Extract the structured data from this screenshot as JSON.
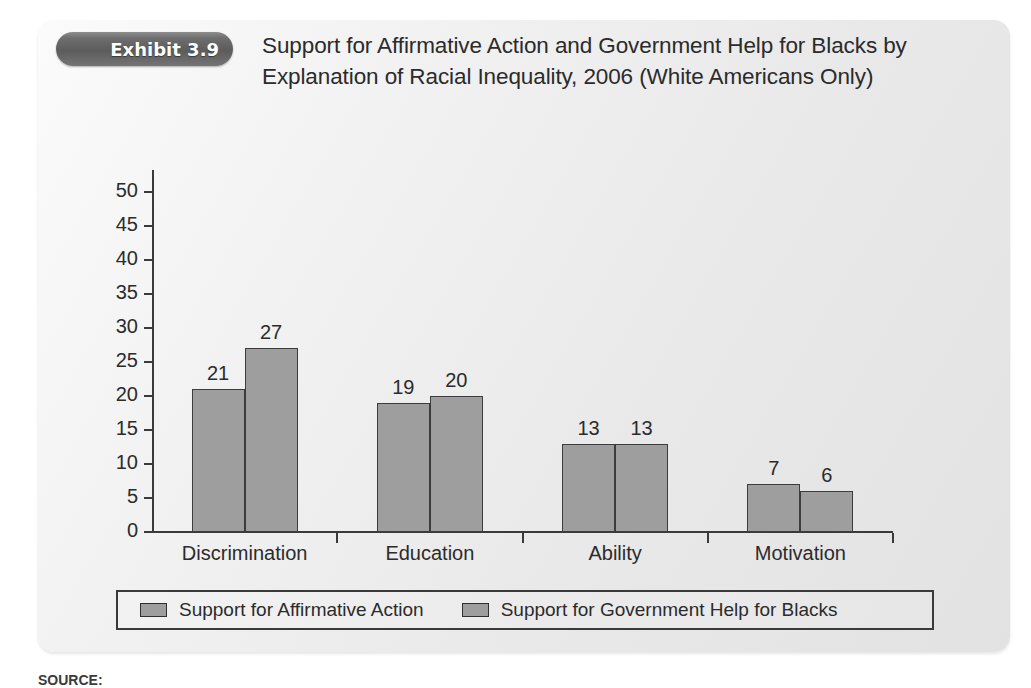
{
  "exhibit": {
    "badge_label": "Exhibit 3.9",
    "title": "Support for Affirmative Action and Government Help for Blacks by Explanation of Racial Inequality, 2006 (White Americans Only)"
  },
  "source": {
    "prefix": "SOURCE:",
    "text": ""
  },
  "colors": {
    "panel_light": "#fbfbfb",
    "panel_dark": "#e2e2e2",
    "bar_fill": "#9e9e9e",
    "bar_stroke": "#3c3c3c",
    "axis": "#3a3a3a",
    "badge_dark": "#5c5c5c",
    "text": "#2b2b2b"
  },
  "chart_data": {
    "type": "bar",
    "title": "Support for Affirmative Action and Government Help for Blacks by Explanation of Racial Inequality, 2006 (White Americans Only)",
    "xlabel": "",
    "ylabel": "",
    "ylim": [
      0,
      50
    ],
    "yticks": [
      0,
      5,
      10,
      15,
      20,
      25,
      30,
      35,
      40,
      45,
      50
    ],
    "ytick_labels": [
      "0",
      "5",
      "10",
      "15",
      "20",
      "25",
      "30",
      "35",
      "40",
      "45",
      "50"
    ],
    "grid": false,
    "legend_position": "bottom",
    "categories": [
      "Discrimination",
      "Education",
      "Ability",
      "Motivation"
    ],
    "series": [
      {
        "name": "Support for Affirmative Action",
        "values": [
          21,
          19,
          13,
          7
        ],
        "labels": [
          "21",
          "19",
          "13",
          "7"
        ]
      },
      {
        "name": "Support for Government Help for Blacks",
        "values": [
          27,
          20,
          13,
          6
        ],
        "labels": [
          "27",
          "20",
          "13",
          "6"
        ]
      }
    ]
  }
}
